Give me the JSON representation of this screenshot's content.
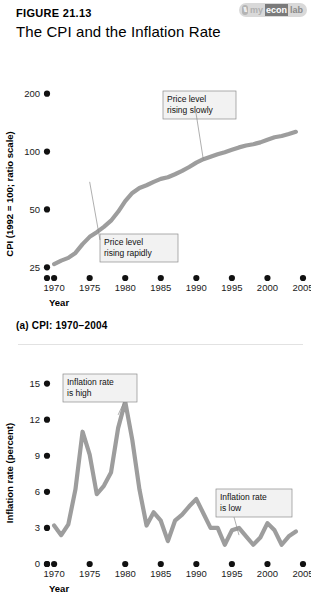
{
  "header": {
    "figure_number": "FIGURE 21.13",
    "title": "The CPI and the Inflation Rate",
    "brand": {
      "mark": "\\\\",
      "my": "my",
      "econ": "econ",
      "lab": "lab"
    }
  },
  "panel_a": {
    "caption": "(a) CPI: 1970–2004"
  },
  "colors": {
    "line": "#9d9d9d",
    "annotation_fill": "#f2f2f2",
    "annotation_stroke": "#8c8c8c",
    "axis_dot": "#111111"
  },
  "chart_data": [
    {
      "type": "line",
      "id": "cpi",
      "title": "CPI: 1970–2004",
      "xlabel": "Year",
      "ylabel": "CPI (1992 = 100; ratio scale)",
      "yscale": "log",
      "ylim": [
        22,
        230
      ],
      "yticks": [
        25,
        50,
        100,
        200
      ],
      "ytick_labels": [
        "25",
        "50",
        "100",
        "200"
      ],
      "xlim": [
        1969,
        2005
      ],
      "xticks": [
        1970,
        1975,
        1980,
        1985,
        1990,
        1995,
        2000,
        2005
      ],
      "xtick_labels": [
        "1970",
        "1975",
        "1980",
        "1985",
        "1990",
        "1995",
        "2000",
        "2005"
      ],
      "grid": false,
      "legend": "none",
      "series": [
        {
          "name": "CPI",
          "x": [
            1970,
            1971,
            1972,
            1973,
            1974,
            1975,
            1976,
            1977,
            1978,
            1979,
            1980,
            1981,
            1982,
            1983,
            1984,
            1985,
            1986,
            1987,
            1988,
            1989,
            1990,
            1991,
            1992,
            1993,
            1994,
            1995,
            1996,
            1997,
            1998,
            1999,
            2000,
            2001,
            2002,
            2003,
            2004
          ],
          "values": [
            26.0,
            27.1,
            28.0,
            29.7,
            33.0,
            36.0,
            38.1,
            40.6,
            43.7,
            48.6,
            55.2,
            60.9,
            64.7,
            66.8,
            69.6,
            72.1,
            73.5,
            76.2,
            79.3,
            83.1,
            87.6,
            91.3,
            94.0,
            96.8,
            99.3,
            102.1,
            105.1,
            107.5,
            109.2,
            111.6,
            115.3,
            118.6,
            120.5,
            123.3,
            126.6
          ]
        }
      ],
      "annotations": [
        {
          "id": "rising-slowly",
          "text_lines": [
            "Price level",
            "rising slowly"
          ],
          "anchor_x": 1991,
          "anchor_y": 90
        },
        {
          "id": "rising-rapidly",
          "text_lines": [
            "Price level",
            "rising rapidly"
          ],
          "anchor_x": 1975,
          "anchor_y": 36
        }
      ]
    },
    {
      "type": "line",
      "id": "inflation",
      "title": "Inflation rate",
      "xlabel": "Year",
      "ylabel": "Inflation rate (percent)",
      "yscale": "linear",
      "ylim": [
        0,
        15.8
      ],
      "yticks": [
        0,
        3,
        6,
        9,
        12,
        15
      ],
      "ytick_labels": [
        "0",
        "3",
        "6",
        "9",
        "12",
        "15"
      ],
      "xlim": [
        1969,
        2005
      ],
      "xticks": [
        1970,
        1975,
        1980,
        1985,
        1990,
        1995,
        2000,
        2005
      ],
      "xtick_labels": [
        "1970",
        "1975",
        "1980",
        "1985",
        "1990",
        "1995",
        "2000",
        "2005"
      ],
      "grid": false,
      "legend": "none",
      "series": [
        {
          "name": "Inflation rate (percent)",
          "x": [
            1970,
            1971,
            1972,
            1973,
            1974,
            1975,
            1976,
            1977,
            1978,
            1979,
            1980,
            1981,
            1982,
            1983,
            1984,
            1985,
            1986,
            1987,
            1988,
            1989,
            1990,
            1991,
            1992,
            1993,
            1994,
            1995,
            1996,
            1997,
            1998,
            1999,
            2000,
            2001,
            2002,
            2003,
            2004
          ],
          "values": [
            3.2,
            2.4,
            3.3,
            6.2,
            11.0,
            9.1,
            5.8,
            6.5,
            7.6,
            11.3,
            13.5,
            10.3,
            6.2,
            3.2,
            4.3,
            3.6,
            1.9,
            3.6,
            4.1,
            4.8,
            5.4,
            4.2,
            3.0,
            3.0,
            1.6,
            2.8,
            3.0,
            2.3,
            1.6,
            2.2,
            3.4,
            2.8,
            1.6,
            2.3,
            2.7
          ]
        }
      ],
      "annotations": [
        {
          "id": "inflation-high",
          "text_lines": [
            "Inflation rate",
            "is high"
          ],
          "anchor_x": 1979,
          "anchor_y": 12.4
        },
        {
          "id": "inflation-low",
          "text_lines": [
            "Inflation rate",
            "is low"
          ],
          "anchor_x": 1996,
          "anchor_y": 2.4
        }
      ]
    }
  ]
}
